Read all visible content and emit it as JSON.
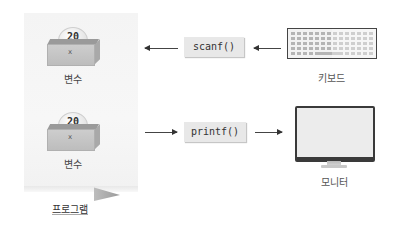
{
  "program": {
    "label": "프로그램",
    "variables": [
      {
        "value": "20",
        "name": "x",
        "label": "변수"
      },
      {
        "value": "20",
        "name": "x",
        "label": "변수"
      }
    ]
  },
  "functions": {
    "input": "scanf()",
    "output": "printf()"
  },
  "devices": {
    "input": {
      "icon": "keyboard-icon",
      "label": "키보드"
    },
    "output": {
      "icon": "monitor-icon",
      "label": "모니터"
    }
  },
  "flows": [
    {
      "from": "키보드",
      "via": "scanf()",
      "to": "변수"
    },
    {
      "from": "변수",
      "via": "printf()",
      "to": "모니터"
    }
  ]
}
